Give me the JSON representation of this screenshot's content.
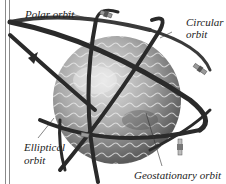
{
  "diagram": {
    "colors": {
      "background": "#ffffff",
      "orbit_band": "#2a2a2a",
      "earth_light": "#d9d9d9",
      "earth_dark": "#6e6e6e",
      "text": "#222222",
      "border": "#8a8a8a"
    },
    "labels": {
      "polar": "Polar orbit",
      "circular_line1": "Circular",
      "circular_line2": "orbit",
      "elliptical_line1": "Elliptical",
      "elliptical_line2": "orbit",
      "geostationary": "Geostationary orbit"
    },
    "icons": [
      "earth-globe",
      "satellite",
      "orbit-band",
      "direction-arrow"
    ]
  }
}
